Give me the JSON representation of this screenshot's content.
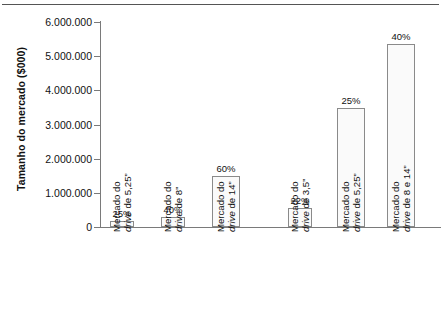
{
  "chart_data": {
    "type": "bar",
    "title": "",
    "subtitle": "",
    "xlabel": "",
    "ylabel": "Tamanho do mercado ($000)",
    "ylim": [
      0,
      6000000
    ],
    "ytick_labels": [
      "0",
      "1.000.000",
      "2.000.000",
      "3.000.000",
      "4.000.000",
      "5.000.000",
      "6.000.000"
    ],
    "ytick_values": [
      0,
      1000000,
      2000000,
      3000000,
      4000000,
      5000000,
      6000000
    ],
    "grid": false,
    "legend": "none",
    "bar_fill_color": "#fafafa",
    "bar_border_color": "#8a8a8a",
    "axis_color": "#7a7a7a",
    "text_color": "#111111",
    "categories": [
      "Mercado do drive de 5,25”",
      "Mercado do drive de 8”",
      "Mercado do drive de 14”",
      "Mercado do drive de 3,5”",
      "Mercado do drive de 5,25”",
      "Mercado do drive de 8 e 14”"
    ],
    "category_lines": [
      {
        "line1": "Mercado do",
        "line2_pre": "drive",
        "line2_post": " de 5,25”"
      },
      {
        "line1": "Mercado do",
        "line2_pre": "drive",
        "line2_post": " de 8”"
      },
      {
        "line1": "Mercado do",
        "line2_pre": "drive",
        "line2_post": " de 14”"
      },
      {
        "line1": "Mercado do",
        "line2_pre": "drive",
        "line2_post": " de 3,5”"
      },
      {
        "line1": "Mercado do",
        "line2_pre": "drive",
        "line2_post": " de 5,25”"
      },
      {
        "line1": "Mercado do",
        "line2_pre": "drive",
        "line2_post": " de 8 e 14”"
      }
    ],
    "values": [
      180000,
      300000,
      1480000,
      560000,
      3480000,
      5350000
    ],
    "data_labels": [
      "25%",
      "40%",
      "60%",
      "22%",
      "25%",
      "40%"
    ],
    "groups": [
      {
        "name": "grupo-1",
        "indices": [
          0,
          1,
          2
        ]
      },
      {
        "name": "grupo-2",
        "indices": [
          3,
          4,
          5
        ]
      }
    ],
    "bar_geometry": [
      {
        "left": 110,
        "width": 24
      },
      {
        "left": 161,
        "width": 24
      },
      {
        "left": 212,
        "width": 28
      },
      {
        "left": 288,
        "width": 24
      },
      {
        "left": 337,
        "width": 28
      },
      {
        "left": 387,
        "width": 28
      }
    ]
  }
}
